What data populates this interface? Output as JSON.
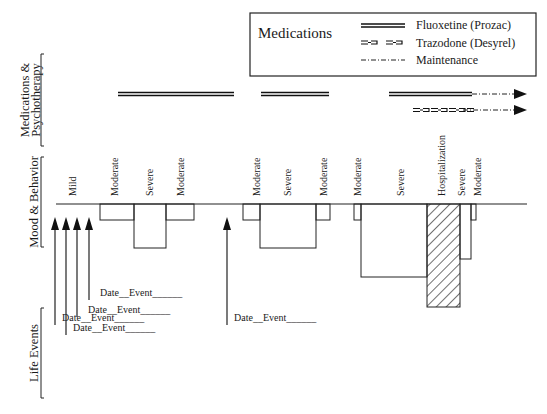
{
  "legend": {
    "title": "Medications",
    "items": [
      {
        "label": "Fluoxetine (Prozac)",
        "style": "double-solid"
      },
      {
        "label": "Trazodone (Desyrel)",
        "style": "trazodone-pattern"
      },
      {
        "label": "Maintenance",
        "style": "dash-dot"
      }
    ]
  },
  "sections": {
    "medications": "Medications &",
    "medications_line2": "Psychotherapy",
    "mood": "Mood & Behavior",
    "life": "Life Events"
  },
  "baseline": {
    "x1": 56,
    "x2": 527,
    "y": 204
  },
  "medication_bars": [
    {
      "drug": "Fluoxetine (Prozac)",
      "x1": 118,
      "x2": 234,
      "y": 94
    },
    {
      "drug": "Fluoxetine (Prozac)",
      "x1": 261,
      "x2": 329,
      "y": 94
    },
    {
      "drug": "Fluoxetine (Prozac)",
      "x1": 389,
      "x2": 472,
      "y": 94,
      "maintenance_to": 527
    },
    {
      "drug": "Trazodone (Desyrel)",
      "x1": 413,
      "x2": 463,
      "y": 110,
      "maintenance_to": 527
    }
  ],
  "mood_segments": [
    {
      "label": "Mild",
      "x1": 56,
      "x2": 100,
      "depth": 204,
      "label_x": 76
    },
    {
      "label": "Moderate",
      "x1": 100,
      "x2": 134,
      "depth": 220,
      "label_x": 118
    },
    {
      "label": "Severe",
      "x1": 134,
      "x2": 166,
      "depth": 248,
      "label_x": 153
    },
    {
      "label": "Moderate",
      "x1": 166,
      "x2": 194,
      "depth": 220,
      "label_x": 184
    },
    {
      "label": "Moderate",
      "x1": 243,
      "x2": 260,
      "depth": 220,
      "label_x": 260
    },
    {
      "label": "Severe",
      "x1": 260,
      "x2": 316,
      "depth": 248,
      "label_x": 291
    },
    {
      "label": "Moderate",
      "x1": 316,
      "x2": 330,
      "depth": 220,
      "label_x": 327
    },
    {
      "label": "Moderate",
      "x1": 354,
      "x2": 361,
      "depth": 220,
      "label_x": 361
    },
    {
      "label": "Severe",
      "x1": 361,
      "x2": 427,
      "depth": 277,
      "label_x": 404
    },
    {
      "label": "Hospitalization",
      "x1": 427,
      "x2": 460,
      "depth": 307,
      "label_x": 445,
      "hatched": true
    },
    {
      "label": "Severe",
      "x1": 460,
      "x2": 471,
      "depth": 259,
      "label_x": 465
    },
    {
      "label": "Moderate",
      "x1": 471,
      "x2": 476,
      "depth": 220,
      "label_x": 481
    }
  ],
  "life_events": [
    {
      "arrow_x": 55,
      "label": "Date__Event______",
      "label_x": 62,
      "label_y": 321
    },
    {
      "arrow_x": 66,
      "label": "Date__Event______",
      "label_x": 73,
      "label_y": 331
    },
    {
      "arrow_x": 77,
      "label": "Date__Event______",
      "label_x": 88,
      "label_y": 313
    },
    {
      "arrow_x": 89,
      "label": "Date__Event______",
      "label_x": 100,
      "label_y": 296
    },
    {
      "arrow_x": 227,
      "label": "Date__Event______",
      "label_x": 234,
      "label_y": 321
    }
  ]
}
